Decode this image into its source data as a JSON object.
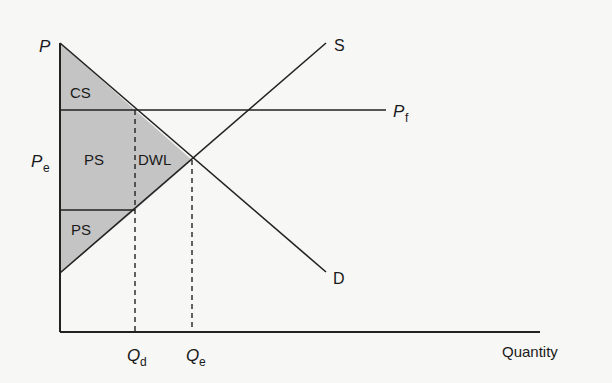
{
  "diagram": {
    "axes": {
      "y_label": "P",
      "x_label": "Quantity"
    },
    "curves": {
      "supply_label": "S",
      "demand_label": "D",
      "price_line_label_main": "P",
      "price_line_label_sub": "f"
    },
    "price_labels": {
      "equilibrium_main": "P",
      "equilibrium_sub": "e"
    },
    "quantity_labels": {
      "qd_main": "Q",
      "qd_sub": "d",
      "qe_main": "Q",
      "qe_sub": "e"
    },
    "regions": {
      "consumer_surplus": "CS",
      "producer_surplus_upper": "PS",
      "producer_surplus_lower": "PS",
      "deadweight_loss": "DWL"
    },
    "colors": {
      "shade": "#c4c4c4",
      "line": "#222222",
      "background": "#f7f7f5"
    }
  }
}
